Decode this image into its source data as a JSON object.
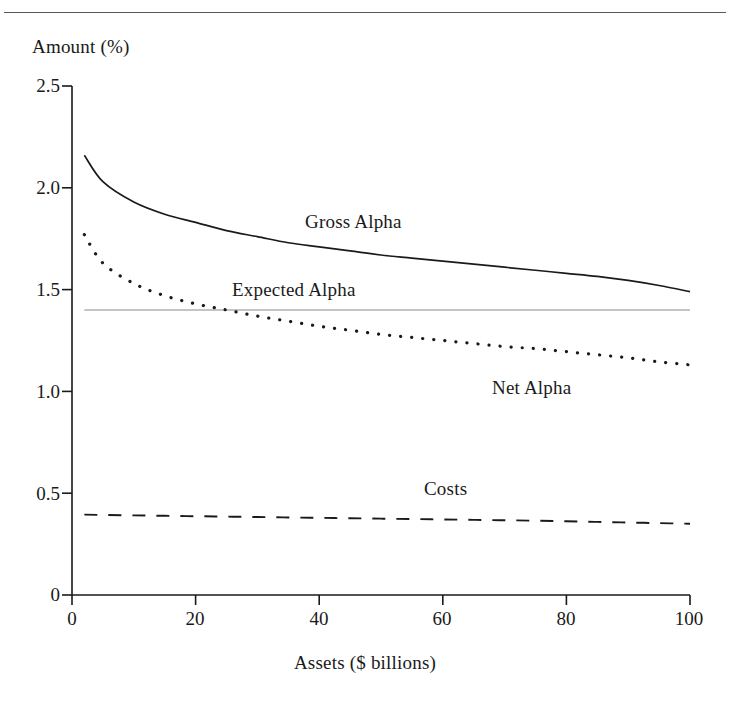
{
  "figure": {
    "y_axis_title": "Amount (%)",
    "x_axis_title": "Assets ($ billions)",
    "series_labels": {
      "gross_alpha": "Gross Alpha",
      "expected_alpha": "Expected Alpha",
      "net_alpha": "Net Alpha",
      "costs": "Costs"
    },
    "colors": {
      "ink": "#1a1a1a",
      "rule": "#585858",
      "expected_line": "#8a8a8a",
      "background": "#ffffff"
    }
  },
  "chart_data": {
    "type": "line",
    "title": "",
    "xlabel": "Assets ($ billions)",
    "ylabel": "Amount (%)",
    "xlim": [
      0,
      100
    ],
    "ylim": [
      0,
      2.5
    ],
    "grid": false,
    "legend": "inline-annotations",
    "xticks": [
      "0",
      "20",
      "40",
      "60",
      "80",
      "100"
    ],
    "xtick_values": [
      0,
      20,
      40,
      60,
      80,
      100
    ],
    "yticks": [
      "0",
      "0.5",
      "1.0",
      "1.5",
      "2.0",
      "2.5"
    ],
    "ytick_values": [
      0,
      0.5,
      1.0,
      1.5,
      2.0,
      2.5
    ],
    "x": [
      2,
      5,
      10,
      15,
      20,
      25,
      30,
      35,
      40,
      45,
      50,
      55,
      60,
      65,
      70,
      75,
      80,
      85,
      90,
      95,
      100
    ],
    "series": [
      {
        "name": "Gross Alpha",
        "style": "solid",
        "values": [
          2.16,
          2.03,
          1.93,
          1.87,
          1.83,
          1.79,
          1.76,
          1.73,
          1.71,
          1.69,
          1.67,
          1.655,
          1.64,
          1.625,
          1.61,
          1.595,
          1.58,
          1.565,
          1.545,
          1.52,
          1.49
        ]
      },
      {
        "name": "Expected Alpha",
        "style": "thin-solid-horizontal",
        "values": [
          1.4,
          1.4,
          1.4,
          1.4,
          1.4,
          1.4,
          1.4,
          1.4,
          1.4,
          1.4,
          1.4,
          1.4,
          1.4,
          1.4,
          1.4,
          1.4,
          1.4,
          1.4,
          1.4,
          1.4,
          1.4
        ]
      },
      {
        "name": "Net Alpha",
        "style": "dotted",
        "values": [
          1.77,
          1.63,
          1.53,
          1.47,
          1.43,
          1.4,
          1.37,
          1.345,
          1.32,
          1.3,
          1.28,
          1.265,
          1.25,
          1.235,
          1.22,
          1.21,
          1.195,
          1.18,
          1.165,
          1.145,
          1.13
        ]
      },
      {
        "name": "Costs",
        "style": "dashed",
        "values": [
          0.395,
          0.393,
          0.391,
          0.389,
          0.387,
          0.385,
          0.383,
          0.381,
          0.379,
          0.377,
          0.375,
          0.373,
          0.371,
          0.369,
          0.367,
          0.365,
          0.362,
          0.359,
          0.356,
          0.353,
          0.35
        ]
      }
    ],
    "annotations": [
      {
        "text": "Gross Alpha",
        "x": 39,
        "y": 1.83
      },
      {
        "text": "Expected Alpha",
        "x": 33,
        "y": 1.54
      },
      {
        "text": "Net Alpha",
        "x": 68,
        "y": 1.06
      },
      {
        "text": "Costs",
        "x": 57,
        "y": 0.48
      }
    ],
    "crossing_point": {
      "description": "Net Alpha crosses Expected Alpha",
      "x": 19.6,
      "y": 1.4
    }
  }
}
